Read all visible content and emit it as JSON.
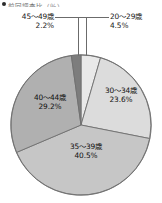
{
  "header": {
    "bullet_icon": "bullet-icon",
    "fragment_text": "前回調査比（％）"
  },
  "callouts": [
    {
      "id": "45-49",
      "label": "45〜49歳",
      "percent": "2.2%"
    },
    {
      "id": "20-29",
      "label": "20〜29歳",
      "percent": "4.5%"
    }
  ],
  "slice_labels": [
    {
      "id": "40-44",
      "label": "40〜44歳",
      "percent": "29.2%"
    },
    {
      "id": "30-34",
      "label": "30〜34歳",
      "percent": "23.6%"
    },
    {
      "id": "35-39",
      "label": "35〜39歳",
      "percent": "40.5%"
    }
  ],
  "chart_data": {
    "type": "pie",
    "title": "",
    "categories": [
      "20〜29歳",
      "30〜34歳",
      "35〜39歳",
      "40〜44歳",
      "45〜49歳"
    ],
    "values": [
      4.5,
      23.6,
      40.5,
      29.2,
      2.2
    ],
    "value_labels": [
      "4.5%",
      "23.6%",
      "40.5%",
      "29.2%",
      "2.2%"
    ],
    "unit": "%",
    "start_angle_deg": 0,
    "direction": "clockwise",
    "legend_position": "none",
    "grid": false,
    "colors": [
      "#e9e9e9",
      "#dcdcdc",
      "#c6c6c6",
      "#b0b0b0",
      "#7d7d7d"
    ],
    "stroke_color": "#6f6f6f",
    "label_placement": [
      "callout",
      "inside",
      "inside",
      "inside",
      "callout"
    ]
  }
}
